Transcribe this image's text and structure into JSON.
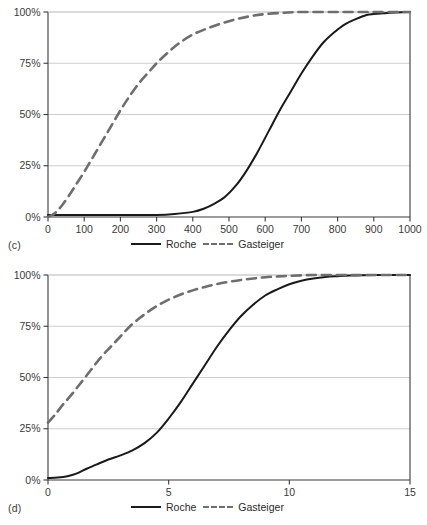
{
  "figure": {
    "panels": [
      {
        "tag": "(c)",
        "legend": [
          {
            "label": "Roche",
            "style": "solid",
            "color": "#1a1a1a"
          },
          {
            "label": "Gasteiger",
            "style": "dashed",
            "color": "#6e6e6e"
          }
        ]
      },
      {
        "tag": "(d)",
        "legend": [
          {
            "label": "Roche",
            "style": "solid",
            "color": "#1a1a1a"
          },
          {
            "label": "Gasteiger",
            "style": "dashed",
            "color": "#6e6e6e"
          }
        ]
      }
    ],
    "colors": {
      "roche": "#1a1a1a",
      "gasteiger": "#6e6e6e",
      "gridline": "#c9c9c9",
      "axis": "#3a3a3a",
      "background": "#ffffff"
    }
  },
  "chart_data": [
    {
      "type": "line",
      "panel": "(c)",
      "title": "",
      "xlabel": "",
      "ylabel": "",
      "xlim": [
        0,
        1000
      ],
      "ylim": [
        0,
        100
      ],
      "xticks": [
        0,
        100,
        200,
        300,
        400,
        500,
        600,
        700,
        800,
        900,
        1000
      ],
      "xticklabels": [
        "0",
        "100",
        "200",
        "300",
        "400",
        "500",
        "600",
        "700",
        "800",
        "900",
        "1000"
      ],
      "yticks": [
        0,
        25,
        50,
        75,
        100
      ],
      "yticklabels": [
        "0%",
        "25%",
        "50%",
        "75%",
        "100%"
      ],
      "grid": "horizontal",
      "legend_position": "below-axis-center",
      "series": [
        {
          "name": "Roche",
          "style": "solid",
          "color": "#1a1a1a",
          "x": [
            0,
            25,
            50,
            100,
            150,
            200,
            250,
            300,
            350,
            400,
            430,
            460,
            490,
            520,
            550,
            580,
            610,
            640,
            670,
            700,
            730,
            760,
            790,
            820,
            850,
            880,
            900,
            930,
            960,
            1000
          ],
          "y": [
            1,
            1,
            1,
            1,
            1,
            1,
            1,
            1,
            1.5,
            2.5,
            4,
            6.5,
            10,
            15.5,
            23,
            32,
            42,
            52,
            61,
            70,
            78,
            85,
            90,
            94,
            96.5,
            98.5,
            99,
            99.4,
            99.7,
            100
          ]
        },
        {
          "name": "Gasteiger",
          "style": "dashed",
          "color": "#6e6e6e",
          "x": [
            0,
            20,
            40,
            60,
            80,
            100,
            120,
            140,
            160,
            180,
            200,
            220,
            250,
            280,
            300,
            330,
            360,
            400,
            440,
            480,
            520,
            560,
            600,
            650,
            700,
            800,
            900,
            1000
          ],
          "y": [
            0,
            2,
            6,
            11,
            16.5,
            22,
            28,
            34,
            40,
            46,
            52,
            57.5,
            65,
            71,
            75,
            80,
            84.5,
            89,
            92,
            94.5,
            96.5,
            98,
            99,
            99.6,
            100,
            100,
            100,
            100
          ]
        }
      ]
    },
    {
      "type": "line",
      "panel": "(d)",
      "title": "",
      "xlabel": "",
      "ylabel": "",
      "xlim": [
        0,
        15
      ],
      "ylim": [
        0,
        100
      ],
      "xticks": [
        0,
        5,
        10,
        15
      ],
      "xticklabels": [
        "0",
        "5",
        "10",
        "15"
      ],
      "yticks": [
        0,
        25,
        50,
        75,
        100
      ],
      "yticklabels": [
        "0%",
        "25%",
        "50%",
        "75%",
        "100%"
      ],
      "grid": "horizontal",
      "legend_position": "below-axis-center",
      "series": [
        {
          "name": "Roche",
          "style": "solid",
          "color": "#1a1a1a",
          "x": [
            0,
            0.4,
            0.8,
            1.2,
            1.6,
            2.0,
            2.5,
            3.0,
            3.5,
            4.0,
            4.5,
            5.0,
            5.5,
            6.0,
            6.5,
            7.0,
            7.5,
            8.0,
            8.5,
            9.0,
            9.5,
            10.0,
            10.5,
            11.0,
            11.5,
            12.0,
            12.5,
            13.0,
            14.0,
            15.0
          ],
          "y": [
            1,
            1.2,
            1.8,
            3.2,
            5.5,
            7.5,
            10,
            12,
            14.5,
            18,
            23,
            30,
            38,
            47,
            56,
            65,
            73,
            80,
            85.5,
            90,
            93,
            95.5,
            97.2,
            98.3,
            99,
            99.4,
            99.7,
            99.9,
            100,
            100
          ]
        },
        {
          "name": "Gasteiger",
          "style": "dashed",
          "color": "#6e6e6e",
          "x": [
            0,
            0.3,
            0.6,
            1.0,
            1.4,
            1.8,
            2.2,
            2.6,
            3.0,
            3.4,
            3.8,
            4.2,
            4.6,
            5.0,
            5.5,
            6.0,
            6.5,
            7.0,
            7.5,
            8.0,
            8.5,
            9.0,
            9.5,
            10.0,
            11.0,
            12.0,
            13.0,
            15.0
          ],
          "y": [
            28,
            32,
            36.5,
            42,
            48,
            54,
            60,
            65,
            70,
            75,
            79,
            82.5,
            85.5,
            88,
            90.5,
            92.5,
            94.2,
            95.6,
            96.7,
            97.6,
            98.3,
            98.9,
            99.3,
            99.6,
            100,
            100,
            100,
            100
          ]
        }
      ]
    }
  ]
}
